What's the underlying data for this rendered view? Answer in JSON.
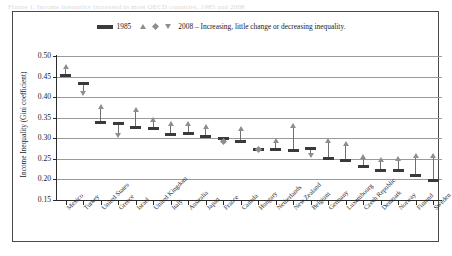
{
  "caption_sliver": "Figure 1.  Income inequality increased in most OECD countries, 1985 and 2008",
  "legend": {
    "bar_label": "1985",
    "marker_label": "2008 – Increasing, little change or decreasing inequality.",
    "swatch_icon": "bar-swatch",
    "up_icon": "triangle-up-icon",
    "diamond_icon": "diamond-icon",
    "down_icon": "triangle-down-icon"
  },
  "chart_data": {
    "type": "scatter",
    "title": "",
    "xlabel": "",
    "ylabel": "Income Inequality (Gini coefficient)",
    "ylim": [
      0.15,
      0.5
    ],
    "yticks": [
      "0.15",
      "0.20",
      "0.25",
      "0.30",
      "0.35",
      "0.40",
      "0.45",
      "0.50"
    ],
    "ytick_values": [
      0.15,
      0.2,
      0.25,
      0.3,
      0.35,
      0.4,
      0.45,
      0.5
    ],
    "grid": true,
    "legend_position": "top-center",
    "categories": [
      "Mexico",
      "Turkey",
      "United States",
      "Greece",
      "Israel",
      "United Kingdom",
      "Italy",
      "Australia",
      "Japan",
      "France",
      "Canada",
      "Hungary",
      "Netherlands",
      "New Zealand",
      "Belgium",
      "Germany",
      "Luxembourg",
      "Czech Republic",
      "Denmark",
      "Norway",
      "Finland",
      "Sweden"
    ],
    "series": [
      {
        "name": "1985",
        "marker": "bar",
        "values": [
          0.452,
          0.434,
          0.338,
          0.336,
          0.326,
          0.325,
          0.309,
          0.312,
          0.304,
          0.3,
          0.293,
          0.273,
          0.272,
          0.271,
          0.274,
          0.251,
          0.247,
          0.232,
          0.221,
          0.222,
          0.209,
          0.198
        ]
      },
      {
        "name": "2008",
        "marker": "triangle",
        "values": [
          0.475,
          0.409,
          0.378,
          0.307,
          0.371,
          0.345,
          0.337,
          0.336,
          0.329,
          0.293,
          0.324,
          0.272,
          0.294,
          0.33,
          0.259,
          0.295,
          0.288,
          0.256,
          0.248,
          0.25,
          0.259,
          0.259
        ],
        "directions": [
          "increasing",
          "decreasing",
          "increasing",
          "decreasing",
          "increasing",
          "increasing",
          "increasing",
          "increasing",
          "increasing",
          "little change",
          "increasing",
          "little change",
          "increasing",
          "increasing",
          "decreasing",
          "increasing",
          "increasing",
          "increasing",
          "increasing",
          "increasing",
          "increasing",
          "increasing"
        ]
      }
    ]
  }
}
